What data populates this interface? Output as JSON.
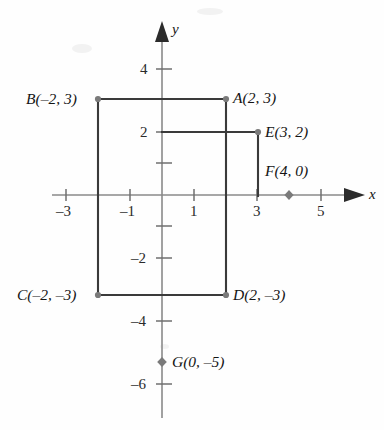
{
  "figure": {
    "kind": "cartesian-coordinate-plane",
    "axes": {
      "x_axis_label": "x",
      "y_axis_label": "y",
      "x_tick_labels": [
        "-3",
        "-1",
        "1",
        "3",
        "5"
      ],
      "y_tick_labels": [
        "4",
        "2",
        "-2",
        "-4",
        "-6"
      ]
    },
    "points": [
      {
        "id": "A",
        "label": "A(2, 3)",
        "name": "A",
        "coords": "(2, 3)",
        "x": 2,
        "y": 3,
        "marker": "dot"
      },
      {
        "id": "B",
        "label": "B(-2, 3)",
        "name": "B",
        "coords": "(-2, 3)",
        "x": -2,
        "y": 3,
        "marker": "dot"
      },
      {
        "id": "C",
        "label": "C(-2, -3)",
        "name": "C",
        "coords": "(-2, -3)",
        "x": -2,
        "y": -3,
        "marker": "dot"
      },
      {
        "id": "D",
        "label": "D(2, -3)",
        "name": "D",
        "coords": "(2, -3)",
        "x": 2,
        "y": -3,
        "marker": "dot"
      },
      {
        "id": "E",
        "label": "E(3, 2)",
        "name": "E",
        "coords": "(3, 2)",
        "x": 3,
        "y": 2,
        "marker": "dot"
      },
      {
        "id": "F",
        "label": "F(4, 0)",
        "name": "F",
        "coords": "(4, 0)",
        "x": 4,
        "y": 0,
        "marker": "diamond"
      },
      {
        "id": "G",
        "label": "G(0, -5)",
        "name": "G",
        "coords": "(0, -5)",
        "x": 0,
        "y": -5,
        "marker": "diamond"
      }
    ],
    "segments": [
      {
        "name": "rectangle-top-BA",
        "from": "B",
        "to": "A"
      },
      {
        "name": "rectangle-left-BC",
        "from": "B",
        "to": "C"
      },
      {
        "name": "rectangle-bottom-CD",
        "from": "C",
        "to": "D"
      },
      {
        "name": "rectangle-right-AD",
        "from": "A",
        "to": "D"
      },
      {
        "name": "segment-yaxis-to-E",
        "from": "(0, 2)",
        "to": "E"
      },
      {
        "name": "segment-E-to-xaxis",
        "from": "E",
        "to": "(3, 0)"
      }
    ],
    "colors": {
      "axis": "#8a8a8a",
      "shape_stroke": "#3a3a3a",
      "marker": "#7a7a7a",
      "text": "#141414",
      "background": "#fefefe"
    }
  }
}
